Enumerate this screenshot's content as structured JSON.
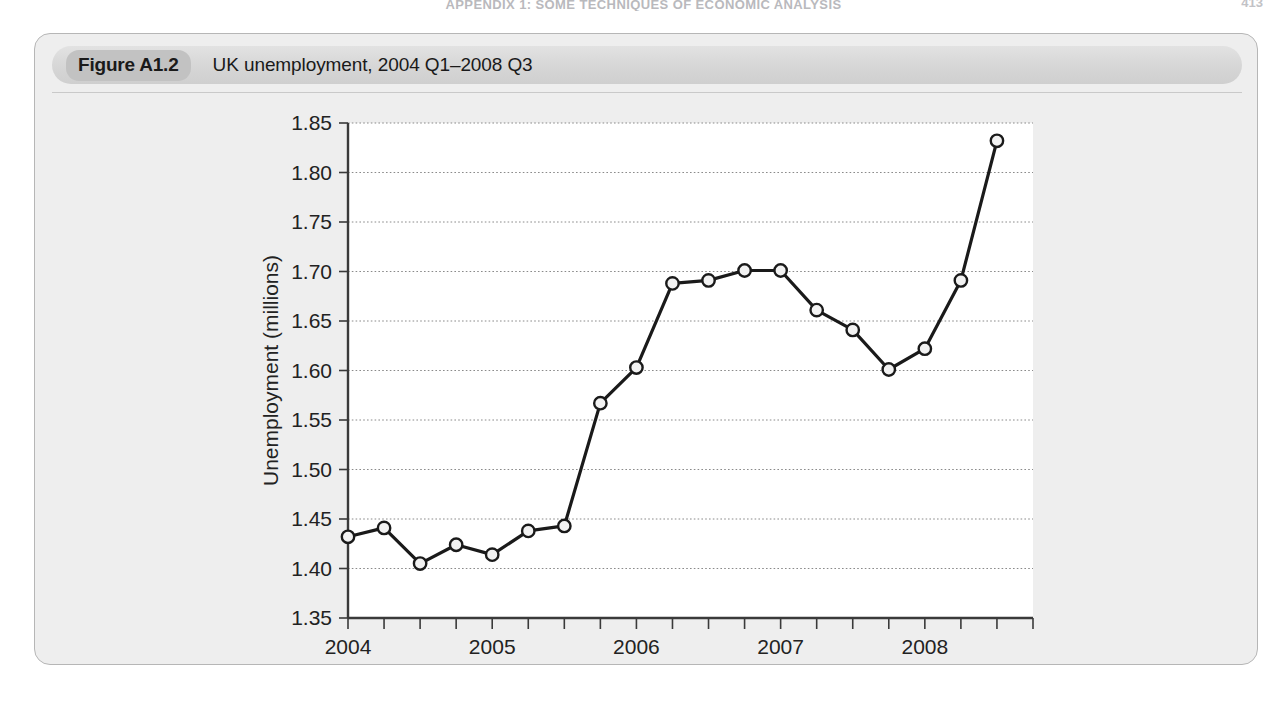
{
  "running_head": {
    "text": "APPENDIX 1: SOME TECHNIQUES OF ECONOMIC ANALYSIS",
    "page": "413"
  },
  "figure": {
    "label": "Figure A1.2",
    "title": "UK unemployment, 2004 Q1–2008 Q3"
  },
  "chart_data": {
    "type": "line",
    "title": "UK unemployment, 2004 Q1–2008 Q3",
    "xlabel": "",
    "ylabel": "Unemployment (millions)",
    "ylim": [
      1.35,
      1.85
    ],
    "ytick_step": 0.05,
    "ytick_labels": [
      "1.35",
      "1.40",
      "1.45",
      "1.50",
      "1.55",
      "1.60",
      "1.65",
      "1.70",
      "1.75",
      "1.80",
      "1.85"
    ],
    "xtick_labels": [
      "2004",
      "2005",
      "2006",
      "2007",
      "2008"
    ],
    "xtick_values": [
      2004,
      2005,
      2006,
      2007,
      2008
    ],
    "xlim": [
      2004.0,
      2008.75
    ],
    "minor_xticks_per_year": 4,
    "grid": "horizontal-dotted",
    "legend": "none",
    "marker": "open-circle",
    "line_color": "#1a1a1a",
    "marker_fill": "#f2f2f2",
    "x": [
      "2004 Q1",
      "2004 Q2",
      "2004 Q3",
      "2004 Q4",
      "2005 Q1",
      "2005 Q2",
      "2005 Q3",
      "2005 Q4",
      "2006 Q1",
      "2006 Q2",
      "2006 Q3",
      "2006 Q4",
      "2007 Q1",
      "2007 Q2",
      "2007 Q3",
      "2007 Q4",
      "2008 Q1",
      "2008 Q2",
      "2008 Q3"
    ],
    "x_numeric": [
      2004.0,
      2004.25,
      2004.5,
      2004.75,
      2005.0,
      2005.25,
      2005.5,
      2005.75,
      2006.0,
      2006.25,
      2006.5,
      2006.75,
      2007.0,
      2007.25,
      2007.5,
      2007.75,
      2008.0,
      2008.25,
      2008.5
    ],
    "values": [
      1.432,
      1.441,
      1.405,
      1.424,
      1.414,
      1.438,
      1.443,
      1.567,
      1.603,
      1.688,
      1.691,
      1.701,
      1.701,
      1.661,
      1.641,
      1.601,
      1.622,
      1.691,
      1.832
    ]
  }
}
